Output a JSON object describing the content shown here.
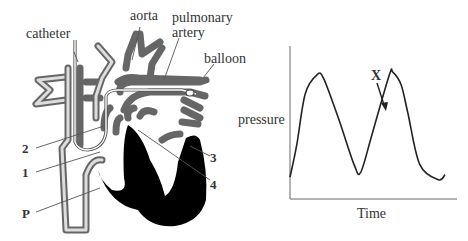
{
  "heart_diagram": {
    "labels": {
      "catheter": "catheter",
      "aorta": "aorta",
      "pulmonary_artery_line1": "pulmonary",
      "pulmonary_artery_line2": "artery",
      "balloon": "balloon",
      "label_2": "2",
      "label_1": "1",
      "label_p": "P",
      "label_3": "3",
      "label_4": "4"
    },
    "colors": {
      "vessel_wall": "#666666",
      "muscle": "#000000"
    }
  },
  "chart_data": {
    "type": "line",
    "title": "",
    "xlabel": "Time",
    "ylabel": "pressure",
    "annotations": [
      {
        "text": "X",
        "arrow_to": "rising limb of second peak"
      }
    ],
    "grid": false,
    "legend": null,
    "series": [
      {
        "name": "pressure",
        "x": [
          0,
          0.2,
          0.45,
          0.8,
          1.0,
          1.45,
          1.9,
          2.1,
          2.45,
          2.95,
          3.05,
          3.3,
          3.5,
          3.85,
          4.4,
          4.6
        ],
        "values": [
          0.1,
          0.35,
          0.75,
          0.9,
          0.87,
          0.55,
          0.2,
          0.14,
          0.45,
          0.9,
          0.92,
          0.82,
          0.6,
          0.2,
          0.08,
          0.12
        ]
      }
    ],
    "axes": {
      "x_ticks": [],
      "y_ticks": []
    }
  }
}
